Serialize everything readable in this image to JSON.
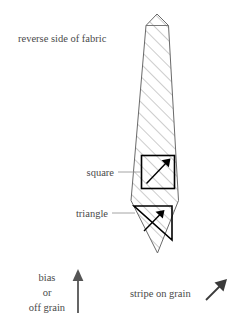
{
  "figure": {
    "type": "sewing-instruction-diagram",
    "background_color": "#ffffff",
    "ink_color": "#4a4a4a",
    "outline_color": "#555555",
    "hatch_color": "#8a8a8a",
    "marker_color": "#000000"
  },
  "labels": {
    "reverse_side": "reverse side of fabric",
    "square": "square",
    "triangle": "triangle",
    "bias_line1": "bias",
    "bias_line2": "or",
    "bias_line3": "off grain",
    "stripe_on_grain": "stripe on grain"
  },
  "markers": [
    {
      "name": "square",
      "shape": "square",
      "arrow_direction": "up-right",
      "arrow_angle_deg": 45
    },
    {
      "name": "triangle",
      "shape": "right-triangle",
      "arrow_direction": "up-right",
      "arrow_angle_deg": 45
    }
  ],
  "arrows": {
    "bias": {
      "direction": "up",
      "angle_deg": 90
    },
    "grain": {
      "direction": "up-right",
      "angle_deg": 45
    }
  },
  "hatching": {
    "angle_deg": 45,
    "direction": "lower-left-to-upper-right",
    "spacing_px": 9
  }
}
